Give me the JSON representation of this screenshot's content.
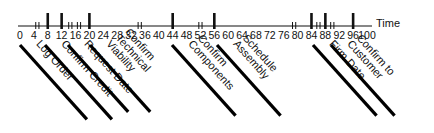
{
  "axis": {
    "title": "Time",
    "min": 0,
    "max": 100,
    "ticks": [
      0,
      4,
      8,
      12,
      16,
      20,
      24,
      28,
      32,
      36,
      40,
      44,
      48,
      52,
      56,
      60,
      64,
      68,
      72,
      76,
      80,
      84,
      88,
      92,
      96,
      100
    ]
  },
  "milestones": [
    8,
    12,
    20,
    44,
    56,
    84,
    88,
    96
  ],
  "breaks": [
    5,
    14.5,
    17,
    34.5,
    52,
    79,
    86,
    90
  ],
  "steps": [
    {
      "lines": [
        "Log Order"
      ],
      "bar_x": 20,
      "bar_len": 100
    },
    {
      "lines": [
        "Confirm Credit"
      ],
      "bar_x": 45,
      "bar_len": 100
    },
    {
      "lines": [
        "Request Date"
      ],
      "bar_x": 68,
      "bar_len": 90
    },
    {
      "lines": [
        "Confirm",
        "Technical",
        "Viability"
      ],
      "bar_x": 90,
      "bar_len": 90
    },
    {
      "lines": [
        "Confirm",
        "Components"
      ],
      "bar_x": 172,
      "bar_len": 95
    },
    {
      "lines": [
        "Schedule",
        "Assembly"
      ],
      "bar_x": 217,
      "bar_len": 95
    },
    {
      "lines": [
        "Firm Date"
      ],
      "bar_x": 313,
      "bar_len": 95
    },
    {
      "lines": [
        "Confirm to",
        "Customer"
      ],
      "bar_x": 331,
      "bar_len": 95
    }
  ],
  "chart_data": {
    "type": "timeline",
    "title": "",
    "xlabel": "Time",
    "xlim": [
      0,
      100
    ],
    "tick_labels": [
      "0",
      "4",
      "8",
      "12",
      "16",
      "20",
      "24",
      "28",
      "32",
      "36",
      "40",
      "44",
      "48",
      "52",
      "56",
      "60",
      "64",
      "68",
      "72",
      "76",
      "80",
      "84",
      "88",
      "92",
      "96",
      "100"
    ],
    "milestone_times": [
      8,
      12,
      20,
      44,
      56,
      84,
      88,
      96
    ],
    "break_marks": [
      5,
      14.5,
      17,
      34.5,
      52,
      79,
      86,
      90
    ],
    "events": [
      {
        "label": "Log Order",
        "time": 8
      },
      {
        "label": "Confirm Credit",
        "time": 12
      },
      {
        "label": "Request Date",
        "time": 20
      },
      {
        "label": "Confirm Technical Viability",
        "time": 44
      },
      {
        "label": "Confirm Components",
        "time": 56
      },
      {
        "label": "Schedule Assembly",
        "time": 84
      },
      {
        "label": "Firm Date",
        "time": 88
      },
      {
        "label": "Confirm to Customer",
        "time": 96
      }
    ],
    "grid": false
  }
}
